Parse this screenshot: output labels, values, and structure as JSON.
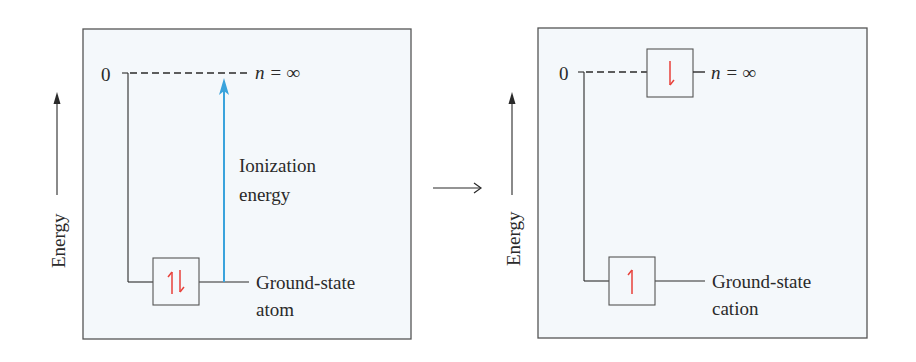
{
  "colors": {
    "panel_bg": "#f4f8fb",
    "panel_border": "#555555",
    "line": "#2a2a2a",
    "ionization_arrow": "#3aa3dc",
    "electron_spin": "#e8413a"
  },
  "left_panel": {
    "axis_label": "Energy",
    "zero_label": "0",
    "top_level_label": "n = ∞",
    "arrow_label_line1": "Ionization",
    "arrow_label_line2": "energy",
    "orbital_spin": "⇅",
    "ground_label_line1": "Ground-state",
    "ground_label_line2": "atom"
  },
  "process_arrow": "→",
  "right_panel": {
    "axis_label": "Energy",
    "zero_label": "0",
    "top_level_label": "n = ∞",
    "top_orbital_spin": "↓",
    "orbital_spin": "↑",
    "ground_label_line1": "Ground-state",
    "ground_label_line2": "cation"
  }
}
